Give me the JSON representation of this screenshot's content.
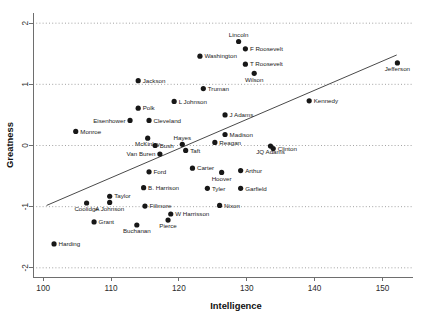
{
  "chart_data": {
    "type": "scatter",
    "title": "",
    "xlabel": "Intelligence",
    "ylabel": "Greatness",
    "xlim": [
      98.5,
      154.5
    ],
    "ylim": [
      -2.15,
      2.15
    ],
    "xticks": [
      100,
      110,
      120,
      130,
      140,
      150
    ],
    "yticks": [
      -2,
      -1,
      0,
      1,
      2
    ],
    "grid": "horizontal-dotted",
    "legend": "none",
    "trendline": {
      "label": "regression line",
      "x_start": 100.5,
      "y_start": -0.98,
      "x_end": 152.1,
      "y_end": 1.48
    },
    "points": [
      {
        "label": "Harding",
        "x": 101.6,
        "y": -1.61,
        "lx": "right"
      },
      {
        "label": "Coolidge",
        "x": 106.4,
        "y": -0.94,
        "lx": "below"
      },
      {
        "label": "Grant",
        "x": 107.5,
        "y": -1.25,
        "lx": "right"
      },
      {
        "label": "Monroe",
        "x": 104.8,
        "y": 0.23,
        "lx": "right"
      },
      {
        "label": "Taylor",
        "x": 109.8,
        "y": -0.83,
        "lx": "right"
      },
      {
        "label": "A Johnson",
        "x": 109.8,
        "y": -0.93,
        "lx": "below"
      },
      {
        "label": "Buchanan",
        "x": 113.8,
        "y": -1.3,
        "lx": "below"
      },
      {
        "label": "Fillmore",
        "x": 115.0,
        "y": -0.99,
        "lx": "right"
      },
      {
        "label": "Eisenhower",
        "x": 112.8,
        "y": 0.41,
        "lx": "left"
      },
      {
        "label": "Polk",
        "x": 114.0,
        "y": 0.61,
        "lx": "right"
      },
      {
        "label": "Jackson",
        "x": 114.0,
        "y": 1.06,
        "lx": "right"
      },
      {
        "label": "Cleveland",
        "x": 115.6,
        "y": 0.41,
        "lx": "right"
      },
      {
        "label": "McKinley",
        "x": 115.4,
        "y": 0.12,
        "lx": "below"
      },
      {
        "label": "Bush",
        "x": 116.5,
        "y": 0.0,
        "lx": "right"
      },
      {
        "label": "Van Buren",
        "x": 117.2,
        "y": -0.14,
        "lx": "left"
      },
      {
        "label": "B. Harrison",
        "x": 114.8,
        "y": -0.69,
        "lx": "right"
      },
      {
        "label": "Ford",
        "x": 115.6,
        "y": -0.43,
        "lx": "right"
      },
      {
        "label": "Pierce",
        "x": 118.4,
        "y": -1.22,
        "lx": "below"
      },
      {
        "label": "W Harrisson",
        "x": 118.8,
        "y": -1.12,
        "lx": "right"
      },
      {
        "label": "L Johnson",
        "x": 119.3,
        "y": 0.72,
        "lx": "right"
      },
      {
        "label": "Truman",
        "x": 123.6,
        "y": 0.93,
        "lx": "right"
      },
      {
        "label": "Hayes",
        "x": 120.5,
        "y": 0.02,
        "lx": "above"
      },
      {
        "label": "Taft",
        "x": 121.0,
        "y": -0.08,
        "lx": "right"
      },
      {
        "label": "Carter",
        "x": 122.0,
        "y": -0.37,
        "lx": "right"
      },
      {
        "label": "Tyler",
        "x": 124.2,
        "y": -0.7,
        "lx": "right"
      },
      {
        "label": "Nixon",
        "x": 126.0,
        "y": -0.98,
        "lx": "right"
      },
      {
        "label": "Hoover",
        "x": 126.3,
        "y": -0.44,
        "lx": "below"
      },
      {
        "label": "Arthur",
        "x": 129.1,
        "y": -0.41,
        "lx": "right"
      },
      {
        "label": "Garfield",
        "x": 129.1,
        "y": -0.7,
        "lx": "right"
      },
      {
        "label": "J Adams",
        "x": 126.8,
        "y": 0.5,
        "lx": "right"
      },
      {
        "label": "Madison",
        "x": 126.8,
        "y": 0.18,
        "lx": "right"
      },
      {
        "label": "Reagan",
        "x": 125.3,
        "y": 0.05,
        "lx": "right"
      },
      {
        "label": "JQ Adams",
        "x": 133.5,
        "y": -0.01,
        "lx": "below"
      },
      {
        "label": "Clinton",
        "x": 133.9,
        "y": -0.05,
        "lx": "right"
      },
      {
        "label": "Washington",
        "x": 123.1,
        "y": 1.46,
        "lx": "right"
      },
      {
        "label": "Lincoln",
        "x": 128.8,
        "y": 1.7,
        "lx": "above"
      },
      {
        "label": "F Roosevelt",
        "x": 129.8,
        "y": 1.58,
        "lx": "right"
      },
      {
        "label": "T Roosevelt",
        "x": 129.8,
        "y": 1.33,
        "lx": "right"
      },
      {
        "label": "Wilson",
        "x": 131.1,
        "y": 1.18,
        "lx": "below"
      },
      {
        "label": "Kennedy",
        "x": 139.2,
        "y": 0.73,
        "lx": "right"
      },
      {
        "label": "Jefferson",
        "x": 152.2,
        "y": 1.35,
        "lx": "below"
      }
    ]
  }
}
